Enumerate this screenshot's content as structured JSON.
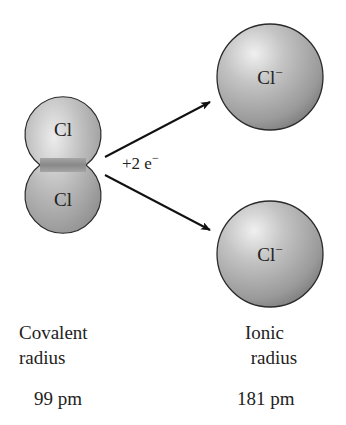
{
  "molecule": {
    "atoms": [
      {
        "symbol": "Cl"
      },
      {
        "symbol": "Cl"
      }
    ]
  },
  "reaction": {
    "label": "+2 e",
    "superscript": "−"
  },
  "ions": [
    {
      "symbol": "Cl",
      "charge": "−"
    },
    {
      "symbol": "Cl",
      "charge": "−"
    }
  ],
  "captions": {
    "covalent": {
      "line1": "Covalent",
      "line2": "radius",
      "value": "99 pm"
    },
    "ionic": {
      "line1": "Ionic",
      "line2": "radius",
      "value": "181 pm"
    }
  },
  "colors": {
    "sphere_light": "#e4e4e4",
    "sphere_mid": "#b3b3b3",
    "sphere_dark": "#7d7d7d",
    "outline": "#2a2a2a",
    "arrow": "#111111"
  }
}
